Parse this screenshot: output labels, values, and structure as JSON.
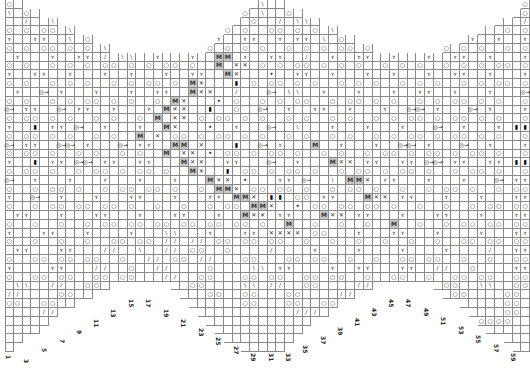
{
  "chart_title": "",
  "grid": {
    "columns": 60,
    "origin_x": 5,
    "origin_y": 0,
    "cell_w": 8.75,
    "cell_h": 8.8,
    "col_top_row": [
      0,
      0,
      1,
      1,
      2,
      2,
      3,
      3,
      4,
      4,
      5,
      5,
      6,
      6,
      6,
      6,
      6,
      6,
      6,
      6,
      6,
      6,
      6,
      5,
      4,
      3,
      2,
      1,
      0,
      0,
      0,
      0,
      1,
      1,
      2,
      2,
      3,
      3,
      4,
      4,
      5,
      5,
      6,
      6,
      6,
      6,
      6,
      6,
      6,
      6,
      5,
      5,
      4,
      4,
      3,
      3,
      2,
      2,
      1,
      0
    ],
    "col_bottom_row": [
      39,
      38,
      37,
      37,
      36,
      35,
      34,
      34,
      33,
      33,
      32,
      32,
      31,
      31,
      31,
      31,
      31,
      31,
      31,
      32,
      33,
      34,
      35,
      36,
      37,
      38,
      38,
      39,
      39,
      39,
      39,
      39,
      38,
      37,
      36,
      35,
      35,
      34,
      33,
      33,
      32,
      32,
      31,
      31,
      31,
      31,
      31,
      31,
      31,
      32,
      33,
      33,
      34,
      35,
      36,
      37,
      37,
      38,
      39,
      39
    ]
  },
  "symbols": {
    "yarn_over": "○",
    "k2tog": "/",
    "ssk": "\\",
    "twist": "ʏ",
    "make_one": "M",
    "cross": "✕",
    "bobble": "▮",
    "dot": "•",
    "cluster": "◎→"
  },
  "rows": [
    "O O \\  O \\ O  \\ O   O O O  \\ O  \\  O  O  \\ O \\ O  O O O",
    "\\ O \\ O \\ O \\ O  O O  \\ O \\ O \\ O  O O O \\ O \\ O O  O",
    "  / \\ O \\ O \\  O O / O  O  / \\ O \\ O \\ O  O O \\ O  /",
    "O O O \\ O \\ O  O O O  O O  O O O \\ O \\ O O O O O  O O",
    "Y  Y  \\ O \\ O  Y Y  Y  Y  Y Y \\ O \\  Y Y  Y Y  Y Y",
    "O O O O O \\ O O O O O O O O O O O O O \\ O O O O O O O",
    " Y  Y  Y / \\  Y  Y  M Y  Y  / Y  Y  Y  Y  Y  Y  Y",
    "O O O O O O O O O O  M X O O O O O O O O O O O O O O",
    "Y  Y  Y  Y  Y  Y  Y  MX  •  Y  Y  Y  Y  Y  Y  Y  Y",
    "O O O O O O O O O MX  ▮ O O O O O O O O O O O O O O",
    " Y @ Y  Y  Y  Y  MX  /  @ \\  Y  Y  Y  Y  Y  Y  @",
    "O O O O O O O O MX  • O O O O  O O O O O O O O O O",
    "@ Y  @ Y  Y  Y MX  ▮ O  @ Y  Y  Y  Y  @ Y  @ Y  Y",
    "O O O O O O O M X O O O O O O O O O O O O O O O O",
    "Y ▮ Y @ Y  Y MX  • Y  @ \\  Y  Y  Y  @ Y  Y ▮",
    "O O O O O O M X O O O O O O O O O O O O O O O O O",
    "@ Y  @ Y  @ Y  M X  ▮ @ Y  M Y  Y  @ Y  @ Y  Y",
    "O O O O O O O M X • O O O O O O O O O O O O O O",
    "Y ▮ Y @ Y  Y  MX  Y  @ Y  MX Y  Y @ Y  Y ▮",
    "O O O O O O O O MX ▮ O O O O O O O O O O O O O",
    "@ Y  Y  Y  Y  Y  MX •  Y @ \\ MX Y  Y  Y  @ Y",
    "O O O O O O O O O MX O O O O O O O O O O O O",
    "Y @ Y  Y  Y  Y  Y MX ▮ O Y  MX Y  Y  Y  Y",
    "O O O O O O O O O O MX • O O O O O O O O O",
    " Y  Y  Y  Y  Y  Y MX Y  MX Y  Y  Y  Y  Y",
    "O O O O O O O O O O O M O O O M O O O O O",
    "Y  Y  Y  Y  \\  Y  Y XX O  Y  Y  Y  Y  Y",
    "O O O O O O / / O O O O O O O O O O O O",
    " Y  Y  / \\ / O O  /  Y  Y  Y  Y  / Y",
    "O O O O O / O /  O  O O O O O O O O O",
    "Y  Y  / O /  O  \\ Y  Y Y  Y / O  Y",
    "O O O O O  / O  O O O O O O O O O O",
    " \\ / O /   O  \\ / O  / O  O \\ O",
    "/  O /     O O O  /  O  O  O",
    "O O /       O O O /  O   O",
    "  /          / O      O",
    "             O",
    "",
    ""
  ],
  "column_labels": [
    {
      "label": "1",
      "x": 6,
      "y": 355
    },
    {
      "label": "3",
      "x": 24,
      "y": 359
    },
    {
      "label": "5",
      "x": 42,
      "y": 348
    },
    {
      "label": "7",
      "x": 60,
      "y": 339
    },
    {
      "label": "9",
      "x": 77,
      "y": 330
    },
    {
      "label": "11",
      "x": 94,
      "y": 319
    },
    {
      "label": "13",
      "x": 111,
      "y": 309
    },
    {
      "label": "15",
      "x": 129,
      "y": 299
    },
    {
      "label": "17",
      "x": 146,
      "y": 299
    },
    {
      "label": "19",
      "x": 164,
      "y": 309
    },
    {
      "label": "21",
      "x": 181,
      "y": 319
    },
    {
      "label": "23",
      "x": 199,
      "y": 328
    },
    {
      "label": "25",
      "x": 216,
      "y": 337
    },
    {
      "label": "27",
      "x": 234,
      "y": 346
    },
    {
      "label": "29",
      "x": 251,
      "y": 353
    },
    {
      "label": "31",
      "x": 269,
      "y": 353
    },
    {
      "label": "33",
      "x": 286,
      "y": 353
    },
    {
      "label": "35",
      "x": 303,
      "y": 345
    },
    {
      "label": "37",
      "x": 321,
      "y": 336
    },
    {
      "label": "39",
      "x": 338,
      "y": 327
    },
    {
      "label": "41",
      "x": 355,
      "y": 318
    },
    {
      "label": "43",
      "x": 372,
      "y": 308
    },
    {
      "label": "45",
      "x": 389,
      "y": 299
    },
    {
      "label": "47",
      "x": 406,
      "y": 299
    },
    {
      "label": "49",
      "x": 424,
      "y": 308
    },
    {
      "label": "51",
      "x": 441,
      "y": 317
    },
    {
      "label": "53",
      "x": 459,
      "y": 326
    },
    {
      "label": "55",
      "x": 476,
      "y": 335
    },
    {
      "label": "57",
      "x": 494,
      "y": 344
    },
    {
      "label": "59",
      "x": 511,
      "y": 353
    }
  ],
  "colors": {
    "grid_line": "#8a8a8a",
    "shade": "#c8c8c8",
    "symbol": "#333333",
    "label": "#222222"
  }
}
